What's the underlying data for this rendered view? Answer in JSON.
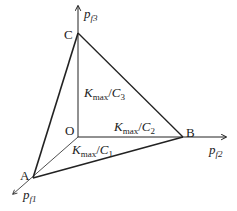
{
  "diagram": {
    "points": {
      "C": {
        "label": "C",
        "x": 78,
        "y": 33
      },
      "O": {
        "label": "O",
        "x": 78,
        "y": 137
      },
      "B": {
        "label": "B",
        "x": 183,
        "y": 137
      },
      "A": {
        "label": "A",
        "x": 33,
        "y": 178
      }
    },
    "axes": {
      "pf3": {
        "base": "p",
        "sub": "f3"
      },
      "pf2": {
        "base": "p",
        "sub": "f2"
      },
      "pf1": {
        "base": "p",
        "sub": "f1"
      }
    },
    "segments": {
      "oc": {
        "K": "K",
        "max": "max",
        "div": "/",
        "C": "C",
        "sub": "3"
      },
      "ob": {
        "K": "K",
        "max": "max",
        "div": "/",
        "C": "C",
        "sub": "2"
      },
      "oa": {
        "K": "K",
        "max": "max",
        "div": "/",
        "C": "C",
        "sub": "1"
      }
    },
    "colors": {
      "line": "#222222",
      "background": "#ffffff"
    }
  }
}
